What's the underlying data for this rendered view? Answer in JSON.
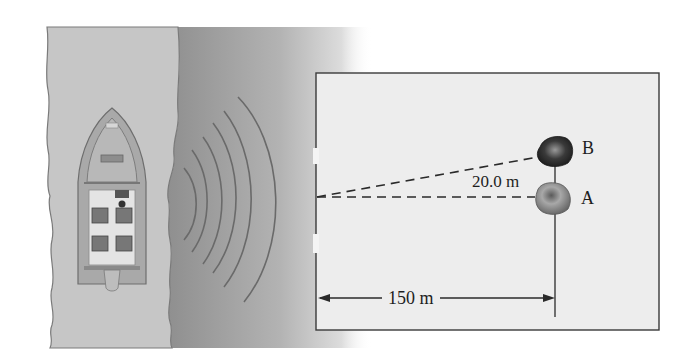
{
  "figure": {
    "type": "sonar-diagram",
    "colors": {
      "water_light": "#c9c9c9",
      "water_dark": "#9a9a9a",
      "box_fill": "#ededed",
      "line": "#2a2a2a"
    }
  },
  "labels": {
    "rock_b": "B",
    "rock_a": "A",
    "separation": "20.0 m",
    "range": "150 m"
  },
  "measurements": {
    "horizontal_distance_m": 150,
    "separation_m": 20.0
  },
  "objects": {
    "boat": "boat-top-view",
    "sonar_waves": 6,
    "rocks": [
      "A",
      "B"
    ]
  }
}
